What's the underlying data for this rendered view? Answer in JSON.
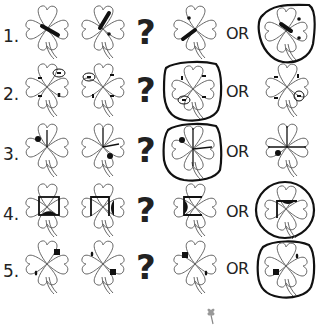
{
  "worksheet": {
    "question_mark": "?",
    "or_label": "OR",
    "rows": [
      {
        "number": "1.",
        "answer_circled": "option_b"
      },
      {
        "number": "2.",
        "answer_circled": "option_a"
      },
      {
        "number": "3.",
        "answer_circled": "option_a"
      },
      {
        "number": "4.",
        "answer_circled": "option_b"
      },
      {
        "number": "5.",
        "answer_circled": "option_b"
      }
    ]
  },
  "colors": {
    "ink": "#222222",
    "outline": "#555555",
    "background": "#ffffff"
  }
}
